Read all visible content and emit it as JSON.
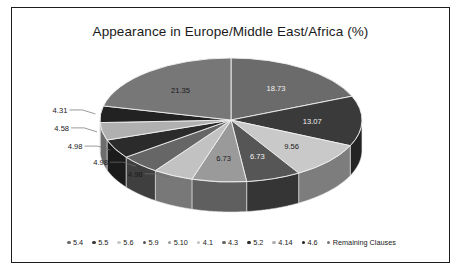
{
  "chart_data": {
    "type": "pie",
    "title": "Appearance in Europe/Middle East/Africa (%)",
    "xlabel": "",
    "ylabel": "",
    "legend_position": "bottom",
    "grid": false,
    "three_d": true,
    "categories": [
      "5.4",
      "5.5",
      "5.6",
      "5.9",
      "5.10",
      "4.1",
      "4.3",
      "5.2",
      "4.14",
      "4.6",
      "Remaining Clauses"
    ],
    "values": [
      18.73,
      13.07,
      9.56,
      6.73,
      6.73,
      4.98,
      4.98,
      4.98,
      4.58,
      4.31,
      21.35
    ],
    "labels": [
      "18.73",
      "13.07",
      "9.56",
      "6.73",
      "6.73",
      "4.98",
      "4.98",
      "4.98",
      "4.58",
      "4.31",
      "21.35"
    ],
    "colors": [
      "#6b6b6b",
      "#3a3a3a",
      "#c9c9c9",
      "#565656",
      "#9a9a9a",
      "#c2c2c2",
      "#666666",
      "#2b2b2b",
      "#b0b0b0",
      "#222222",
      "#777777"
    ]
  },
  "chart": {
    "title": "Appearance in Europe/Middle East/Africa (%)",
    "slices": [
      {
        "label": "5.4",
        "value": "18.73",
        "color": "#6b6b6b",
        "text_tone": "light"
      },
      {
        "label": "5.5",
        "value": "13.07",
        "color": "#3a3a3a",
        "text_tone": "light"
      },
      {
        "label": "5.6",
        "value": "9.56",
        "color": "#c9c9c9",
        "text_tone": "dark"
      },
      {
        "label": "5.9",
        "value": "6.73",
        "color": "#565656",
        "text_tone": "light"
      },
      {
        "label": "5.10",
        "value": "6.73",
        "color": "#9a9a9a",
        "text_tone": "dark"
      },
      {
        "label": "4.1",
        "value": "4.98",
        "color": "#c2c2c2",
        "text_tone": "dark"
      },
      {
        "label": "4.3",
        "value": "4.98",
        "color": "#666666",
        "text_tone": "light"
      },
      {
        "label": "5.2",
        "value": "4.98",
        "color": "#2b2b2b",
        "text_tone": "dark"
      },
      {
        "label": "4.14",
        "value": "4.58",
        "color": "#b0b0b0",
        "text_tone": "dark"
      },
      {
        "label": "4.6",
        "value": "4.31",
        "color": "#222222",
        "text_tone": "light"
      },
      {
        "label": "Remaining Clauses",
        "value": "21.35",
        "color": "#777777",
        "text_tone": "dark"
      }
    ],
    "legend": [
      {
        "label": "5.4",
        "color": "#6b6b6b"
      },
      {
        "label": "5.5",
        "color": "#3a3a3a"
      },
      {
        "label": "5.6",
        "color": "#c9c9c9"
      },
      {
        "label": "5.9",
        "color": "#565656"
      },
      {
        "label": "5.10",
        "color": "#9a9a9a"
      },
      {
        "label": "4.1",
        "color": "#c2c2c2"
      },
      {
        "label": "4.3",
        "color": "#666666"
      },
      {
        "label": "5.2",
        "color": "#2b2b2b"
      },
      {
        "label": "4.14",
        "color": "#b0b0b0"
      },
      {
        "label": "4.6",
        "color": "#222222"
      },
      {
        "label": "Remaining Clauses",
        "color": "#777777"
      }
    ]
  }
}
